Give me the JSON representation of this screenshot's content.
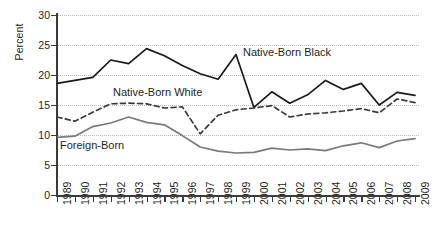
{
  "chart_data": {
    "type": "line",
    "title": "",
    "xlabel": "",
    "ylabel": "Percent",
    "xlim": [
      1989,
      2009
    ],
    "ylim": [
      0,
      30
    ],
    "ytick_step": 5,
    "grid": true,
    "legend_position": "inline-annotations",
    "categories": [
      "1989",
      "1990",
      "1991",
      "1992",
      "1993",
      "1994",
      "1995",
      "1996",
      "1997",
      "1998",
      "1999",
      "2000",
      "2001",
      "2002",
      "2003",
      "2004",
      "2005",
      "2006",
      "2007",
      "2008",
      "2009"
    ],
    "y_ticks": [
      "0",
      "5",
      "10",
      "15",
      "20",
      "25",
      "30"
    ],
    "series": [
      {
        "name": "Native-Born Black",
        "style": "solid",
        "color": "#1a1a1a",
        "values": [
          18.6,
          19.1,
          19.6,
          22.5,
          21.9,
          24.4,
          23.2,
          21.6,
          20.2,
          19.3,
          23.4,
          14.6,
          17.2,
          15.3,
          16.7,
          19.1,
          17.6,
          18.6,
          15.0,
          17.1,
          16.6
        ]
      },
      {
        "name": "Native-Born White",
        "style": "dashed",
        "color": "#3b3b3b",
        "values": [
          13.0,
          12.3,
          13.8,
          15.2,
          15.3,
          15.2,
          14.5,
          14.7,
          10.2,
          13.3,
          14.2,
          14.5,
          14.9,
          13.0,
          13.5,
          13.7,
          14.0,
          14.4,
          13.7,
          16.0,
          15.4
        ]
      },
      {
        "name": "Foreign-Born",
        "style": "solid",
        "color": "#7a7a7a",
        "values": [
          9.6,
          9.8,
          11.4,
          12.0,
          13.0,
          12.1,
          11.7,
          9.9,
          8.0,
          7.3,
          7.0,
          7.1,
          7.8,
          7.5,
          7.7,
          7.4,
          8.2,
          8.7,
          7.9,
          9.0,
          9.4
        ]
      }
    ],
    "annotations": [
      {
        "text": "Native-Born Black",
        "series": "Native-Born Black"
      },
      {
        "text": "Native-Born White",
        "series": "Native-Born White"
      },
      {
        "text": "Foreign-Born",
        "series": "Foreign-Born"
      }
    ],
    "colors": {
      "axis": "#3b3b3b",
      "grid": "#b9b9b9",
      "text": "#231f20",
      "background": "#ffffff"
    }
  }
}
